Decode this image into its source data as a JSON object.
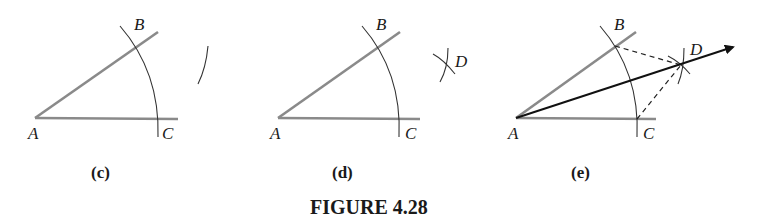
{
  "figure": {
    "title": "FIGURE 4.28",
    "colors": {
      "construction_lines": "#8a8a8a",
      "arcs": "#333333",
      "bisector": "#111111"
    },
    "panels": [
      {
        "caption": "(c)",
        "labels": {
          "A": "A",
          "B": "B",
          "C": "C"
        }
      },
      {
        "caption": "(d)",
        "labels": {
          "A": "A",
          "B": "B",
          "C": "C",
          "D": "D"
        }
      },
      {
        "caption": "(e)",
        "labels": {
          "A": "A",
          "B": "B",
          "C": "C",
          "D": "D"
        }
      }
    ]
  }
}
